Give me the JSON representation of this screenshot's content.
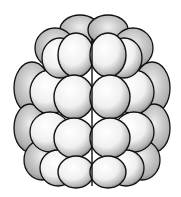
{
  "image": {
    "subject": "stippled illustration of a cluster of spherical cells (morula-like)",
    "colors": {
      "background": "#ffffff",
      "outline": "#111111",
      "fill": "#f4f4f4",
      "shade": "#8a8a8a"
    },
    "rows": [
      {
        "name": "top",
        "count": 6
      },
      {
        "name": "upper-middle",
        "count": 6
      },
      {
        "name": "lower-middle",
        "count": 6
      },
      {
        "name": "bottom",
        "count": 6
      }
    ]
  }
}
